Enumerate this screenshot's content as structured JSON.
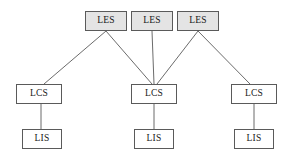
{
  "diagram": {
    "type": "hierarchy-block-diagram",
    "canvas": {
      "width": 293,
      "height": 163,
      "background": "#ffffff"
    },
    "styles": {
      "les_fill": "#e4e4e4",
      "lcs_fill": "#ffffff",
      "lis_fill": "#ffffff",
      "border_color": "#5a5a5a",
      "edge_color": "#5a5a5a",
      "text_color": "#1a1a1a"
    },
    "tiers": [
      {
        "key": "les",
        "label": "LES"
      },
      {
        "key": "lcs",
        "label": "LCS"
      },
      {
        "key": "lis",
        "label": "LIS"
      }
    ],
    "nodes": [
      {
        "id": "les-1",
        "label": "LES",
        "tier": "les",
        "x": 85,
        "y": 11,
        "w": 42,
        "h": 20
      },
      {
        "id": "les-2",
        "label": "LES",
        "tier": "les",
        "x": 131,
        "y": 11,
        "w": 42,
        "h": 20
      },
      {
        "id": "les-3",
        "label": "LES",
        "tier": "les",
        "x": 177,
        "y": 11,
        "w": 42,
        "h": 20
      },
      {
        "id": "lcs-1",
        "label": "LCS",
        "tier": "lcs",
        "x": 16,
        "y": 84,
        "w": 46,
        "h": 20
      },
      {
        "id": "lcs-2",
        "label": "LCS",
        "tier": "lcs",
        "x": 131,
        "y": 84,
        "w": 46,
        "h": 20
      },
      {
        "id": "lcs-3",
        "label": "LCS",
        "tier": "lcs",
        "x": 231,
        "y": 84,
        "w": 46,
        "h": 20
      },
      {
        "id": "lis-1",
        "label": "LIS",
        "tier": "lis",
        "x": 22,
        "y": 129,
        "w": 40,
        "h": 20
      },
      {
        "id": "lis-2",
        "label": "LIS",
        "tier": "lis",
        "x": 134,
        "y": 129,
        "w": 40,
        "h": 20
      },
      {
        "id": "lis-3",
        "label": "LIS",
        "tier": "lis",
        "x": 234,
        "y": 129,
        "w": 40,
        "h": 20
      }
    ],
    "edges": [
      {
        "id": "edge-les1-lcs1",
        "from": "les-1",
        "to": "lcs-1",
        "x1": 106,
        "y1": 31,
        "x2": 44,
        "y2": 84
      },
      {
        "id": "edge-les1-lcs2",
        "from": "les-1",
        "to": "lcs-2",
        "x1": 106,
        "y1": 31,
        "x2": 152,
        "y2": 84
      },
      {
        "id": "edge-les2-lcs2",
        "from": "les-2",
        "to": "lcs-2",
        "x1": 152,
        "y1": 31,
        "x2": 154,
        "y2": 84
      },
      {
        "id": "edge-les3-lcs2",
        "from": "les-3",
        "to": "lcs-2",
        "x1": 198,
        "y1": 31,
        "x2": 157,
        "y2": 84
      },
      {
        "id": "edge-les3-lcs3",
        "from": "les-3",
        "to": "lcs-3",
        "x1": 198,
        "y1": 31,
        "x2": 250,
        "y2": 84
      },
      {
        "id": "edge-lcs1-lis1",
        "from": "lcs-1",
        "to": "lis-1",
        "x1": 41,
        "y1": 104,
        "x2": 41,
        "y2": 129
      },
      {
        "id": "edge-lcs2-lis2",
        "from": "lcs-2",
        "to": "lis-2",
        "x1": 154,
        "y1": 104,
        "x2": 154,
        "y2": 129
      },
      {
        "id": "edge-lcs3-lis3",
        "from": "lcs-3",
        "to": "lis-3",
        "x1": 254,
        "y1": 104,
        "x2": 254,
        "y2": 129
      }
    ]
  }
}
